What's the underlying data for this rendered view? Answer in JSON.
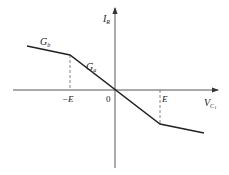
{
  "diagram": {
    "title": "",
    "y_axis_label": "I",
    "y_axis_subscript": "R",
    "x_axis_label": "V",
    "x_axis_subscript": "C",
    "x_axis_subsubscript": "1",
    "origin_label": "0",
    "neg_breakpoint_label": "−E",
    "pos_breakpoint_label": "E",
    "inner_slope_label": "G",
    "inner_slope_subscript": "a",
    "outer_slope_label": "G",
    "outer_slope_subscript": "b",
    "colors": {
      "line": "#222222",
      "axis": "#444444",
      "dash": "#666666"
    }
  }
}
